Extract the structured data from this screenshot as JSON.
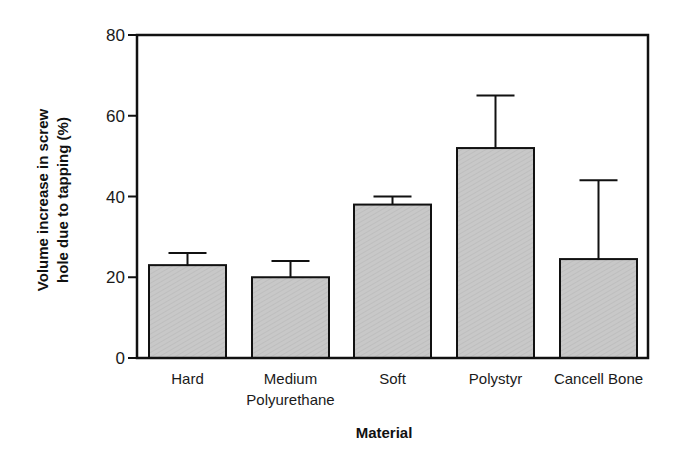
{
  "chart_data": {
    "type": "bar",
    "title": "",
    "xlabel": "Material",
    "ylabel": "Volume increase in screw hole due to tapping (%)",
    "ylabel_lines": [
      "Volume increase in screw",
      "hole due to tapping (%)"
    ],
    "categories": [
      "Hard",
      "Medium Polyurethane",
      "Soft",
      "Polystyr",
      "Cancell Bone"
    ],
    "category_label_lines": [
      [
        "Hard"
      ],
      [
        "Medium",
        "Polyurethane"
      ],
      [
        "Soft"
      ],
      [
        "Polystyr"
      ],
      [
        "Cancell  Bone"
      ]
    ],
    "values": [
      23,
      20,
      38,
      52,
      24.5
    ],
    "error_upper": [
      26,
      24,
      40,
      65,
      44
    ],
    "ylim": [
      0,
      80
    ],
    "yticks": [
      0,
      20,
      40,
      60,
      80
    ],
    "grid": false,
    "legend": null,
    "bar_color": "#c8c8c8",
    "edge_color": "#111111"
  }
}
